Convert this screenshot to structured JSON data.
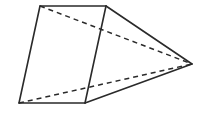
{
  "figure": {
    "type": "geometric-solid-sketch",
    "stroke_color": "#2a2a2a",
    "background": "#ffffff",
    "vertices": {
      "A": {
        "x": 40,
        "y": 6
      },
      "B": {
        "x": 106,
        "y": 6
      },
      "C": {
        "x": 85,
        "y": 103
      },
      "D": {
        "x": 19,
        "y": 103
      },
      "P": {
        "x": 192,
        "y": 64
      }
    },
    "solid_edges": [
      [
        "A",
        "B"
      ],
      [
        "B",
        "C"
      ],
      [
        "C",
        "D"
      ],
      [
        "D",
        "A"
      ],
      [
        "B",
        "P"
      ],
      [
        "C",
        "P"
      ]
    ],
    "dashed_edges": [
      [
        "A",
        "P"
      ],
      [
        "D",
        "P"
      ]
    ]
  }
}
